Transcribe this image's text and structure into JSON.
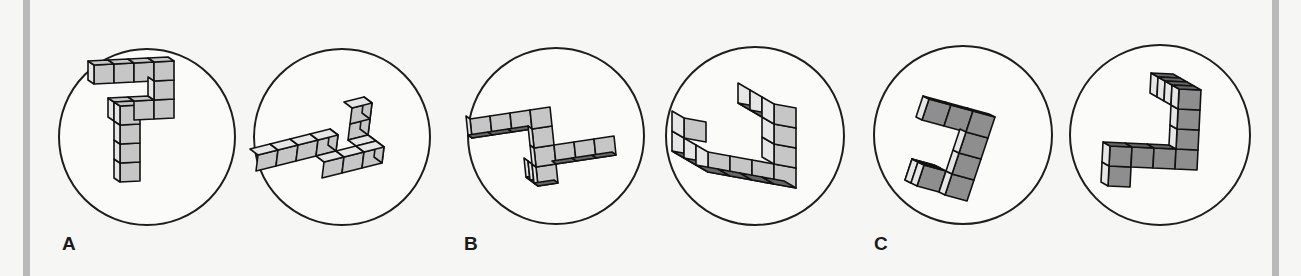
{
  "figure": {
    "panels": [
      {
        "label": "A",
        "label_x": 62,
        "pairs_circles": [
          {
            "cx": 147,
            "cy": 137,
            "r": 88
          },
          {
            "cx": 342,
            "cy": 137,
            "r": 88
          }
        ]
      },
      {
        "label": "B",
        "label_x": 464,
        "pairs_circles": [
          {
            "cx": 556,
            "cy": 136,
            "r": 88
          },
          {
            "cx": 755,
            "cy": 136,
            "r": 89
          }
        ]
      },
      {
        "label": "C",
        "label_x": 874,
        "pairs_circles": [
          {
            "cx": 963,
            "cy": 135,
            "r": 89
          },
          {
            "cx": 1160,
            "cy": 135,
            "r": 90
          }
        ]
      }
    ]
  },
  "colors": {
    "background": "#f6f6f5",
    "border_bar": "#b9b9b9",
    "circle_stroke": "#1e1e1e",
    "face_light": "#e6e6e6",
    "face_mid": "#c6c6c6",
    "face_dark": "#8e8e8e",
    "face_darkest": "#666666"
  }
}
